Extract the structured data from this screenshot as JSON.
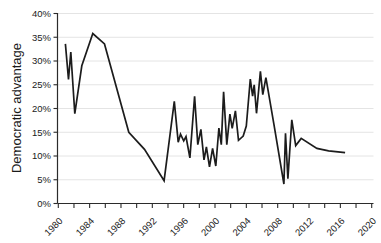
{
  "figure": {
    "title": "",
    "ylabel": "Democratic advantage"
  },
  "chart_data": {
    "type": "line",
    "title": "",
    "xlabel": "",
    "ylabel": "Democratic advantage",
    "xlim": [
      1980,
      2020
    ],
    "ylim": [
      0,
      40
    ],
    "grid": "horizontal-light",
    "legend": "none",
    "colors": {
      "line": "#1c1c1c",
      "axis": "#2b2b2b",
      "grid": "#e4e4e4",
      "text": "#1a1a1a",
      "background": "#ffffff"
    },
    "x_minor_ticks": [
      1980,
      1982,
      1984,
      1986,
      1988,
      1990,
      1992,
      1994,
      1996,
      1998,
      2000,
      2002,
      2004,
      2006,
      2008,
      2010,
      2012,
      2014,
      2016,
      2018,
      2020
    ],
    "x_label_years": [
      1980,
      1984,
      1988,
      1992,
      1996,
      2000,
      2004,
      2008,
      2012,
      2016,
      2020
    ],
    "x_tick_labels": [
      "1980",
      "1984",
      "1988",
      "1992",
      "1996",
      "2000",
      "2004",
      "2008",
      "2012",
      "2016",
      "2020"
    ],
    "y_ticks": [
      0,
      5,
      10,
      15,
      20,
      25,
      30,
      35,
      40
    ],
    "y_tick_labels": [
      "0%",
      "5%",
      "10%",
      "15%",
      "20%",
      "25%",
      "30%",
      "35%",
      "40%"
    ],
    "series": [
      {
        "name": "Democratic advantage",
        "points": [
          [
            1980.9,
            33.6
          ],
          [
            1981.3,
            26.1
          ],
          [
            1981.6,
            31.9
          ],
          [
            1982.1,
            18.9
          ],
          [
            1983.0,
            29.0
          ],
          [
            1984.4,
            35.8
          ],
          [
            1985.9,
            33.6
          ],
          [
            1989.0,
            15.0
          ],
          [
            1991.0,
            11.4
          ],
          [
            1993.5,
            4.8
          ],
          [
            1994.8,
            21.5
          ],
          [
            1995.3,
            12.9
          ],
          [
            1995.6,
            14.6
          ],
          [
            1996.0,
            13.2
          ],
          [
            1996.3,
            14.1
          ],
          [
            1996.8,
            9.6
          ],
          [
            1997.4,
            22.6
          ],
          [
            1997.8,
            12.4
          ],
          [
            1998.2,
            15.6
          ],
          [
            1998.6,
            9.2
          ],
          [
            1998.9,
            11.9
          ],
          [
            1999.3,
            7.7
          ],
          [
            1999.7,
            11.6
          ],
          [
            2000.1,
            7.9
          ],
          [
            2000.5,
            15.9
          ],
          [
            2000.8,
            12.4
          ],
          [
            2001.1,
            23.5
          ],
          [
            2001.5,
            12.4
          ],
          [
            2001.9,
            18.8
          ],
          [
            2002.2,
            15.8
          ],
          [
            2002.6,
            19.5
          ],
          [
            2003.0,
            13.3
          ],
          [
            2003.6,
            14.2
          ],
          [
            2004.0,
            16.3
          ],
          [
            2004.5,
            26.2
          ],
          [
            2004.8,
            22.6
          ],
          [
            2005.0,
            25.0
          ],
          [
            2005.3,
            19.0
          ],
          [
            2005.8,
            27.8
          ],
          [
            2006.1,
            22.9
          ],
          [
            2006.5,
            26.5
          ],
          [
            2007.5,
            16.8
          ],
          [
            2008.8,
            4.1
          ],
          [
            2009.0,
            14.8
          ],
          [
            2009.3,
            5.2
          ],
          [
            2009.8,
            17.6
          ],
          [
            2010.3,
            12.2
          ],
          [
            2011.0,
            13.7
          ],
          [
            2013.0,
            11.6
          ],
          [
            2014.5,
            11.1
          ],
          [
            2016.6,
            10.7
          ]
        ]
      }
    ]
  }
}
